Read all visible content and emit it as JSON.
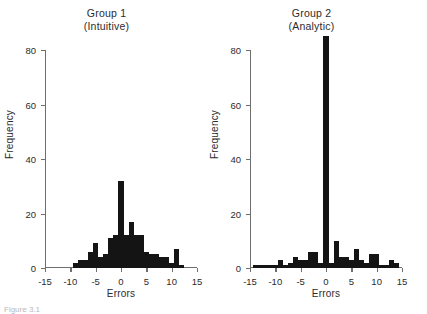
{
  "figure": {
    "background": "#ffffff",
    "bar_color": "#141414",
    "axis_color": "#6f6f6f",
    "text_color": "#2b2b2b",
    "caption": "Figure 3.1"
  },
  "chart_data": [
    {
      "type": "bar",
      "title": "Group 1",
      "subtitle": "(Intuitive)",
      "xlabel": "Errors",
      "ylabel": "Frequency",
      "xlim": [
        -15,
        15
      ],
      "ylim": [
        0,
        80
      ],
      "xticks": [
        -15,
        -10,
        -5,
        0,
        5,
        10,
        15
      ],
      "xtick_labels": [
        "-15",
        "-10",
        "-5",
        "0",
        "5",
        "10",
        "15"
      ],
      "yticks": [
        0,
        20,
        40,
        60,
        80
      ],
      "ytick_labels": [
        "0",
        "20",
        "40",
        "60",
        "80"
      ],
      "grid": false,
      "legend": "none",
      "bin_width": 1,
      "categories": [
        -9,
        -8,
        -7,
        -6,
        -5,
        -4,
        -3,
        -2,
        -1,
        0,
        1,
        2,
        3,
        4,
        5,
        6,
        7,
        8,
        9,
        10,
        11,
        12
      ],
      "values": [
        2,
        3,
        3,
        6,
        9,
        4,
        5,
        11,
        12,
        32,
        12,
        17,
        12,
        12,
        6,
        5,
        5,
        4,
        4,
        2,
        7,
        1
      ]
    },
    {
      "type": "bar",
      "title": "Group 2",
      "subtitle": "(Analytic)",
      "xlabel": "Errors",
      "ylabel": "Frequency",
      "xlim": [
        -15,
        15
      ],
      "ylim": [
        0,
        80
      ],
      "xticks": [
        -15,
        -10,
        -5,
        0,
        5,
        10,
        15
      ],
      "xtick_labels": [
        "-15",
        "-10",
        "-5",
        "0",
        "5",
        "10",
        "15"
      ],
      "yticks": [
        0,
        20,
        40,
        60,
        80
      ],
      "ytick_labels": [
        "0",
        "20",
        "40",
        "60",
        "80"
      ],
      "grid": false,
      "legend": "none",
      "bin_width": 1,
      "categories": [
        -14,
        -13,
        -12,
        -11,
        -10,
        -9,
        -8,
        -7,
        -6,
        -5,
        -4,
        -3,
        -2,
        -1,
        0,
        1,
        2,
        3,
        4,
        5,
        6,
        7,
        8,
        9,
        10,
        11,
        12,
        13,
        14
      ],
      "values": [
        1,
        1,
        1,
        1,
        1,
        3,
        1,
        2,
        4,
        3,
        3,
        6,
        6,
        2,
        85,
        2,
        10,
        4,
        4,
        3,
        7,
        3,
        2,
        5,
        5,
        1,
        1,
        3,
        2
      ]
    }
  ]
}
